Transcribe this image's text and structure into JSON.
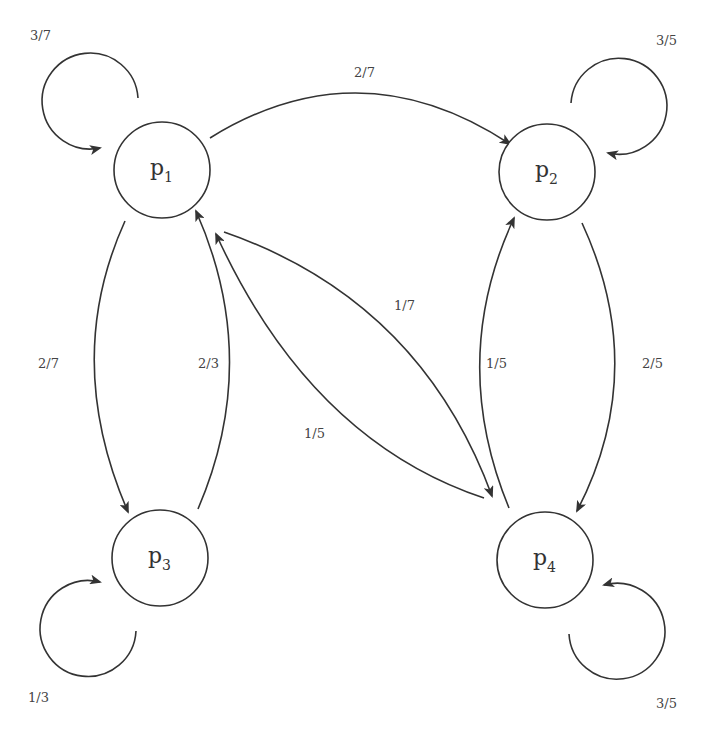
{
  "diagram": {
    "type": "markov-chain-state-diagram",
    "nodes": [
      {
        "id": "p1",
        "base": "p",
        "sub": "1"
      },
      {
        "id": "p2",
        "base": "p",
        "sub": "2"
      },
      {
        "id": "p3",
        "base": "p",
        "sub": "3"
      },
      {
        "id": "p4",
        "base": "p",
        "sub": "4"
      }
    ],
    "edges": [
      {
        "from": "p1",
        "to": "p1",
        "label": "3/7"
      },
      {
        "from": "p1",
        "to": "p2",
        "label": "2/7"
      },
      {
        "from": "p1",
        "to": "p3",
        "label": "2/7"
      },
      {
        "from": "p1",
        "to": "p4",
        "label": "1/7"
      },
      {
        "from": "p2",
        "to": "p2",
        "label": "3/5"
      },
      {
        "from": "p2",
        "to": "p4",
        "label": "2/5"
      },
      {
        "from": "p3",
        "to": "p1",
        "label": "2/3"
      },
      {
        "from": "p3",
        "to": "p3",
        "label": "1/3"
      },
      {
        "from": "p4",
        "to": "p1",
        "label": "1/5"
      },
      {
        "from": "p4",
        "to": "p2",
        "label": "1/5"
      },
      {
        "from": "p4",
        "to": "p4",
        "label": "3/5"
      }
    ]
  },
  "colors": {
    "stroke": "#333333",
    "text": "#444444",
    "background": "#ffffff"
  }
}
